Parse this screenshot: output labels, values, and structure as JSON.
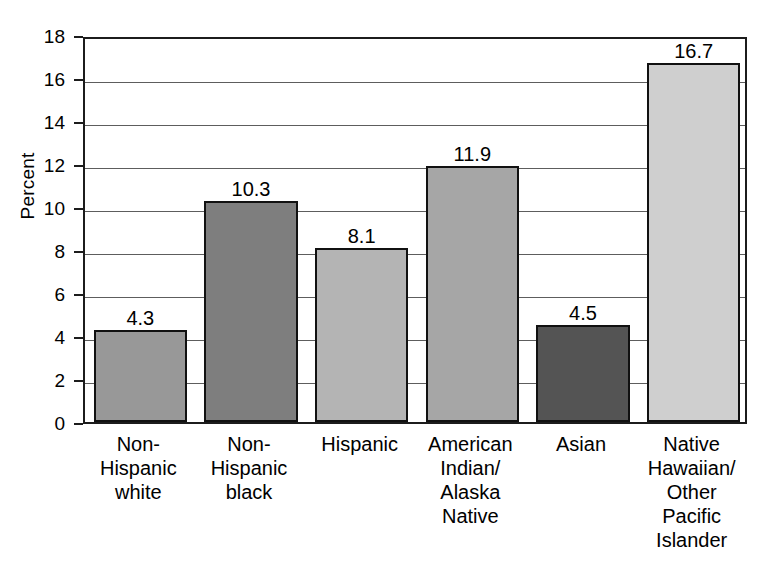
{
  "chart_data": {
    "type": "bar",
    "title": "",
    "xlabel": "",
    "ylabel": "Percent",
    "ylim": [
      0,
      18
    ],
    "ytick_step": 2,
    "yticks": [
      18,
      16,
      14,
      12,
      10,
      8,
      6,
      4,
      2,
      0
    ],
    "grid": true,
    "legend": "none",
    "categories": [
      "Non-Hispanic white",
      "Non-Hispanic black",
      "Hispanic",
      "American Indian/Alaska Native",
      "Asian",
      "Native Hawaiian/Other Pacific Islander"
    ],
    "category_lines": [
      [
        "Non-",
        "Hispanic",
        "white"
      ],
      [
        "Non-",
        "Hispanic",
        "black"
      ],
      [
        "Hispanic"
      ],
      [
        "American",
        "Indian/",
        "Alaska",
        "Native"
      ],
      [
        "Asian"
      ],
      [
        "Native",
        "Hawaiian/",
        "Other",
        "Pacific",
        "Islander"
      ]
    ],
    "values": [
      4.3,
      10.3,
      8.1,
      11.9,
      4.5,
      16.7
    ],
    "value_labels": [
      "4.3",
      "10.3",
      "8.1",
      "11.9",
      "4.5",
      "16.7"
    ],
    "bar_colors": [
      "#989898",
      "#7e7e7e",
      "#b4b4b4",
      "#a6a6a6",
      "#545454",
      "#cfcfcf"
    ],
    "bar_edge_color": "#111111",
    "gridline_color": "#5d5d5d",
    "axis_color": "#1c1c1c",
    "background": "#ffffff"
  }
}
